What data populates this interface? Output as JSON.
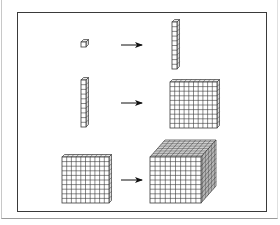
{
  "diagram": {
    "rows": [
      {
        "from": "unit-cube",
        "to": "rod",
        "from_units": 1,
        "to_units": 10
      },
      {
        "from": "rod",
        "to": "flat",
        "from_units": 10,
        "to_units": 100
      },
      {
        "from": "flat",
        "to": "cube",
        "from_units": 100,
        "to_units": 1000
      }
    ],
    "grid_size": 10,
    "colors": {
      "line": "#3a3a3a",
      "fill": "#ffffff",
      "frame": "#3a3a3a",
      "arrow": "#111111"
    }
  }
}
